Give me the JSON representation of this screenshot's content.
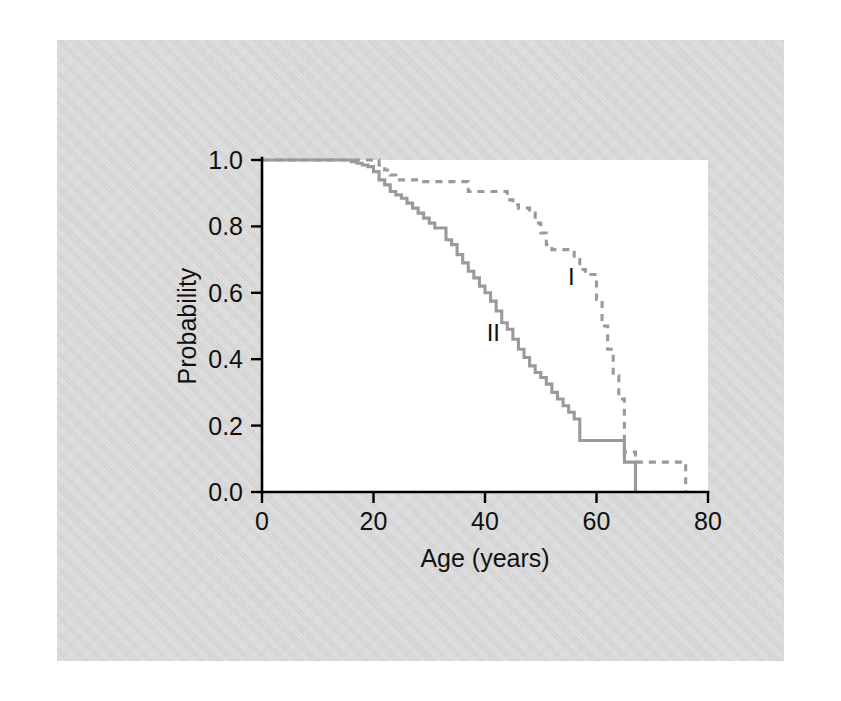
{
  "figure": {
    "background_color": "#d5d5d5",
    "plot_background_color": "#ffffff",
    "page_border_color": "#ffffff"
  },
  "chart_data": {
    "type": "line",
    "subtype": "kaplan-meier-step-survival",
    "title": "",
    "xlabel": "Age (years)",
    "ylabel": "Probability",
    "xlim": [
      0,
      80
    ],
    "ylim": [
      0.0,
      1.0
    ],
    "xticks": [
      0,
      20,
      40,
      60,
      80
    ],
    "xtick_labels": [
      "0",
      "20",
      "40",
      "60",
      "80"
    ],
    "yticks": [
      0.0,
      0.2,
      0.4,
      0.6,
      0.8,
      1.0
    ],
    "ytick_labels": [
      "0.0",
      "0.2",
      "0.4",
      "0.6",
      "0.8",
      "1.0"
    ],
    "grid": false,
    "legend_position": "inline-annotation",
    "series": [
      {
        "name": "I",
        "label": "I",
        "linestyle": "dashed",
        "color": "#9a9a9a",
        "annotation": {
          "text": "I",
          "x": 55.5,
          "y": 0.625
        },
        "x": [
          0,
          5,
          10,
          15,
          19,
          21,
          22,
          23,
          24,
          25,
          26,
          27,
          28,
          29,
          31,
          33,
          35,
          37,
          39,
          41,
          43,
          44,
          45,
          46,
          47,
          48,
          49,
          50,
          51,
          52,
          53,
          54,
          55,
          56,
          57,
          58,
          59,
          60,
          61,
          62,
          63,
          64,
          65,
          67,
          70,
          73,
          76,
          76
        ],
        "y": [
          1.0,
          1.0,
          1.0,
          1.0,
          1.0,
          0.985,
          0.97,
          0.955,
          0.94,
          0.94,
          0.94,
          0.94,
          0.94,
          0.935,
          0.935,
          0.935,
          0.935,
          0.905,
          0.905,
          0.905,
          0.905,
          0.88,
          0.865,
          0.855,
          0.855,
          0.84,
          0.81,
          0.78,
          0.745,
          0.73,
          0.73,
          0.73,
          0.73,
          0.7,
          0.67,
          0.655,
          0.655,
          0.58,
          0.5,
          0.43,
          0.35,
          0.28,
          0.12,
          0.09,
          0.09,
          0.09,
          0.09,
          0.0
        ]
      },
      {
        "name": "II",
        "label": "II",
        "linestyle": "solid",
        "color": "#9a9a9a",
        "annotation": {
          "text": "II",
          "x": 41.5,
          "y": 0.455
        },
        "x": [
          0,
          5,
          10,
          14,
          16,
          17,
          18,
          19,
          20,
          21,
          22,
          23,
          24,
          25,
          26,
          27,
          28,
          29,
          30,
          31,
          32,
          33,
          34,
          35,
          36,
          37,
          38,
          39,
          40,
          41,
          42,
          43,
          44,
          45,
          46,
          47,
          48,
          49,
          50,
          51,
          52,
          53,
          54,
          55,
          56,
          57,
          58,
          59,
          60,
          63,
          65,
          66,
          67,
          67
        ],
        "y": [
          1.0,
          1.0,
          1.0,
          1.0,
          0.995,
          0.99,
          0.985,
          0.98,
          0.965,
          0.94,
          0.925,
          0.905,
          0.895,
          0.885,
          0.87,
          0.855,
          0.84,
          0.825,
          0.81,
          0.795,
          0.795,
          0.76,
          0.745,
          0.715,
          0.69,
          0.665,
          0.645,
          0.62,
          0.6,
          0.575,
          0.545,
          0.51,
          0.49,
          0.46,
          0.43,
          0.405,
          0.38,
          0.36,
          0.345,
          0.325,
          0.3,
          0.28,
          0.26,
          0.24,
          0.22,
          0.155,
          0.155,
          0.155,
          0.155,
          0.155,
          0.09,
          0.09,
          0.09,
          0.0
        ]
      }
    ]
  }
}
